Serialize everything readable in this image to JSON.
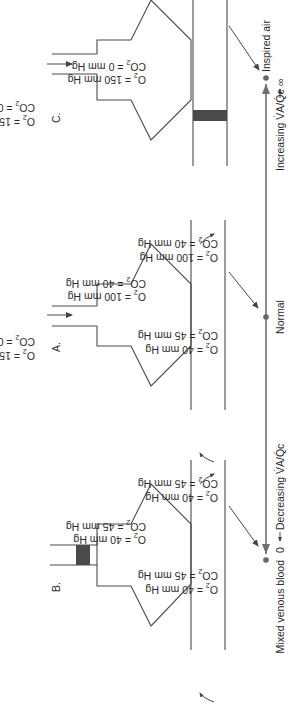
{
  "panels": {
    "B": {
      "letter": "B.",
      "inspired": null,
      "airway": "obstructed",
      "alveolar": {
        "o2": "O2 = 40 mm Hg",
        "co2": "CO2 = 45 mm Hg"
      },
      "capillary_in": {
        "o2": "O2 = 40  mm Hg",
        "co2": "CO2 = 45 mm Hg"
      },
      "capillary_out": {
        "o2": "O2 = 40 mm Hg",
        "co2": "CO2 = 45 mm Hg"
      }
    },
    "A": {
      "letter": "A.",
      "inspired": {
        "o2": "O2 = 150 mm Hg",
        "co2": "CO2 = 0 mm Hg"
      },
      "airway": "open",
      "alveolar": {
        "o2": "O2 = 100 mm Hg",
        "co2": "CO2 = 40 mm Hg"
      },
      "capillary_in": {
        "o2": "O2 = 40 mm Hg",
        "co2": "CO2 = 45 mm Hg"
      },
      "capillary_out": {
        "o2": "O2 = 100 mm Hg",
        "co2": "CO2 = 40 mm Hg"
      }
    },
    "C": {
      "letter": "C.",
      "inspired": {
        "o2": "O2 = 150 mm Hg",
        "co2": "CO2 = 0 mm Hg"
      },
      "airway": "open",
      "alveolar": {
        "o2": "O2 = 150 mm Hg",
        "co2": "CO2 = 0 mm Hg"
      },
      "capillary": "obstructed"
    }
  },
  "axis": {
    "left_point": "Mixed venous blood",
    "left_value": "0",
    "left_direction": "Decreasing V̇A/Q̇c",
    "middle_point": "Normal",
    "right_point": "Inspired air",
    "right_direction": "Increasing V̇A/Q̇c",
    "right_value": "∞"
  }
}
